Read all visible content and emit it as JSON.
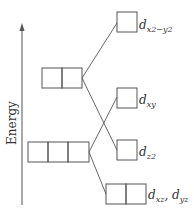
{
  "diagram": {
    "type": "energy-level-diagram",
    "axis": {
      "label": "Energy",
      "direction": "up"
    },
    "colors": {
      "line": "#555555",
      "box": "#555555",
      "text": "#333333"
    },
    "left_levels": [
      {
        "id": "upper-pair",
        "boxes": 2
      },
      {
        "id": "lower-triple",
        "boxes": 3
      }
    ],
    "right_levels": [
      {
        "id": "dx2-y2",
        "main": "d",
        "sub": "x2−y2",
        "boxes": 1
      },
      {
        "id": "dxy",
        "main": "d",
        "sub": "xy",
        "boxes": 1
      },
      {
        "id": "dz2",
        "main": "d",
        "sub": "z2",
        "boxes": 1
      },
      {
        "id": "dxz-dyz",
        "main": "d",
        "sub": "xz",
        "sep": ", ",
        "main2": "d",
        "sub2": "yz",
        "boxes": 2
      }
    ],
    "connections": [
      {
        "from": "upper-pair",
        "to": "dx2-y2"
      },
      {
        "from": "upper-pair",
        "to": "dz2"
      },
      {
        "from": "lower-triple",
        "to": "dxy"
      },
      {
        "from": "lower-triple",
        "to": "dxz-dyz"
      }
    ]
  }
}
